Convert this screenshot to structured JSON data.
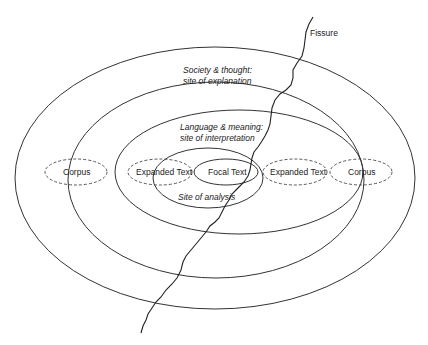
{
  "diagram": {
    "title": "",
    "labels": {
      "fissure": "Fissure",
      "society_line1": "Society & thought:",
      "society_line2": "site of explanation",
      "language_line1": "Language & meaning:",
      "language_line2": "site of interpretation",
      "site_of_analysis": "Site of analysis",
      "focal_text": "Focal Text",
      "expanded_text_left": "Expanded Text",
      "expanded_text_right": "Expanded Text",
      "corpus_left": "Corpus",
      "corpus_right": "Corpus"
    },
    "rings": [
      {
        "name": "society-thought-ring",
        "style": "solid"
      },
      {
        "name": "outer-ring-2",
        "style": "solid"
      },
      {
        "name": "language-meaning-ring",
        "style": "solid"
      },
      {
        "name": "site-of-analysis-ring",
        "style": "solid"
      },
      {
        "name": "focal-text-ring",
        "style": "solid"
      }
    ],
    "nodes": [
      {
        "name": "corpus-left",
        "style": "dashed"
      },
      {
        "name": "expanded-text-left",
        "style": "dashed"
      },
      {
        "name": "expanded-text-right",
        "style": "dashed"
      },
      {
        "name": "corpus-right",
        "style": "dashed"
      }
    ],
    "colors": {
      "line": "#333333",
      "text": "#222222",
      "background": "#ffffff"
    }
  }
}
